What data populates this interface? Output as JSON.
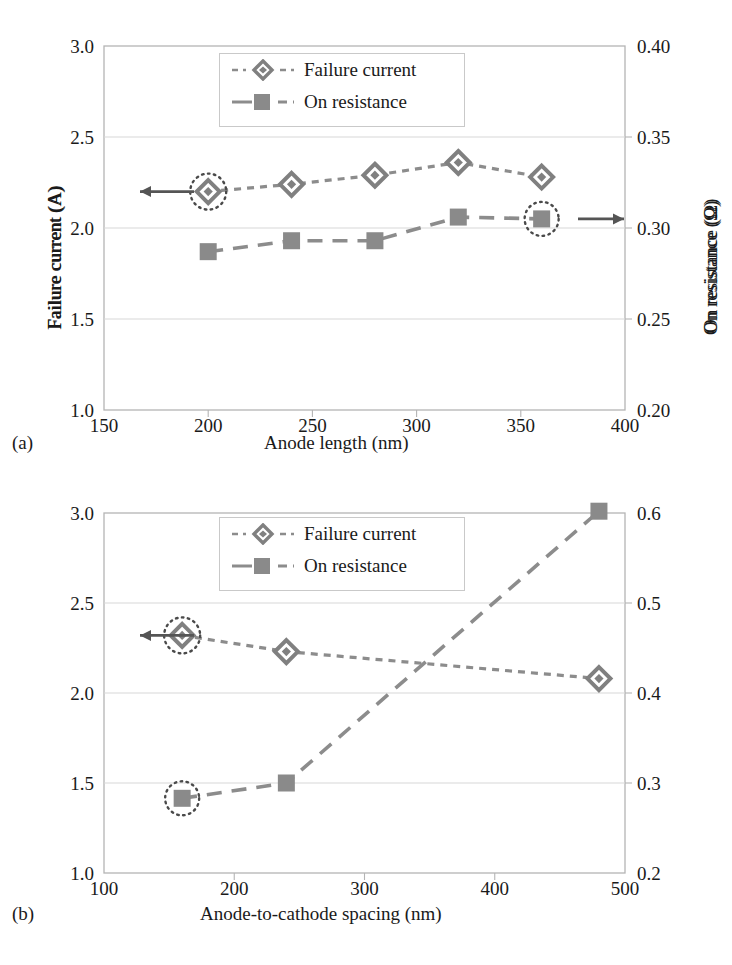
{
  "figure": {
    "panels": [
      {
        "letter": "(a)",
        "xlabel": "Anode length (nm)",
        "ylabel_left": "Failure current (A)",
        "ylabel_right": "On resistance (Ω)",
        "legend": [
          {
            "label": "Failure current",
            "marker": "diamond-marker",
            "style": "dotted"
          },
          {
            "label": "On resistance",
            "marker": "square-marker",
            "style": "dashed"
          }
        ],
        "xticks": [
          "150",
          "200",
          "250",
          "300",
          "350",
          "400"
        ],
        "yticks_left": [
          "1.0",
          "1.5",
          "2.0",
          "2.5",
          "3.0"
        ],
        "yticks_right": [
          "0.20",
          "0.25",
          "0.30",
          "0.35",
          "0.40"
        ],
        "arrow_left": "left-arrow-icon",
        "arrow_right": "right-arrow-icon"
      },
      {
        "letter": "(b)",
        "xlabel": "Anode-to-cathode spacing (nm)",
        "ylabel_left": "Failure current (A)",
        "ylabel_right": "On resistance (Ω)",
        "legend": [
          {
            "label": "Failure current",
            "marker": "diamond-marker",
            "style": "dotted"
          },
          {
            "label": "On resistance",
            "marker": "square-marker",
            "style": "dashed"
          }
        ],
        "xticks": [
          "100",
          "200",
          "300",
          "400",
          "500"
        ],
        "yticks_left": [
          "1.0",
          "1.5",
          "2.0",
          "2.5",
          "3.0"
        ],
        "yticks_right": [
          "0.2",
          "0.3",
          "0.4",
          "0.5",
          "0.6"
        ],
        "arrow_left": "left-arrow-icon",
        "arrow_right": "right-arrow-icon"
      }
    ]
  },
  "colors": {
    "marker_gray": "#808080",
    "line_gray": "#8c8c8c",
    "axis_gray": "#b4b4b4",
    "grid_gray": "#d8d8d8",
    "text": "#1a1a1a",
    "arrow": "#555555"
  },
  "chart_data": [
    {
      "type": "line",
      "panel": "(a)",
      "title": "",
      "xlabel": "Anode length (nm)",
      "ylabel": "Failure current (A)",
      "ylabel_right": "On resistance (Ω)",
      "x": [
        200,
        240,
        280,
        320,
        360
      ],
      "xlim": [
        150,
        400
      ],
      "ylim": [
        1.0,
        3.0
      ],
      "ylim_right": [
        0.2,
        0.4
      ],
      "grid": true,
      "legend_position": "top-center",
      "series": [
        {
          "name": "Failure current",
          "axis": "left",
          "units": "A",
          "marker": "diamond",
          "linestyle": "dotted",
          "values": [
            2.2,
            2.24,
            2.29,
            2.36,
            2.28
          ],
          "highlighted_point_index": 0
        },
        {
          "name": "On resistance",
          "axis": "right",
          "units": "Ω",
          "marker": "square",
          "linestyle": "dashed",
          "values": [
            0.287,
            0.293,
            0.293,
            0.306,
            0.305
          ],
          "highlighted_point_index": 4
        }
      ],
      "annotations": [
        {
          "type": "arrow",
          "direction": "left",
          "note": "points to left axis for Failure current"
        },
        {
          "type": "arrow",
          "direction": "right",
          "note": "points to right axis for On resistance"
        }
      ]
    },
    {
      "type": "line",
      "panel": "(b)",
      "title": "",
      "xlabel": "Anode-to-cathode spacing (nm)",
      "ylabel": "Failure current (A)",
      "ylabel_right": "On resistance (Ω)",
      "x": [
        160,
        240,
        480
      ],
      "xlim": [
        100,
        500
      ],
      "ylim": [
        1.0,
        3.0
      ],
      "ylim_right": [
        0.2,
        0.6
      ],
      "grid": true,
      "legend_position": "top-center",
      "series": [
        {
          "name": "Failure current",
          "axis": "left",
          "units": "A",
          "marker": "diamond",
          "linestyle": "dotted",
          "values": [
            2.32,
            2.23,
            2.08
          ],
          "highlighted_point_index": 0
        },
        {
          "name": "On resistance",
          "axis": "right",
          "units": "Ω",
          "marker": "square",
          "linestyle": "dashed",
          "values": [
            0.283,
            0.3,
            0.602
          ],
          "highlighted_point_index": 0
        }
      ],
      "annotations": [
        {
          "type": "arrow",
          "direction": "left",
          "note": "points to left axis for Failure current"
        },
        {
          "type": "arrow",
          "direction": "right",
          "note": "points to right axis for On resistance"
        }
      ]
    }
  ]
}
